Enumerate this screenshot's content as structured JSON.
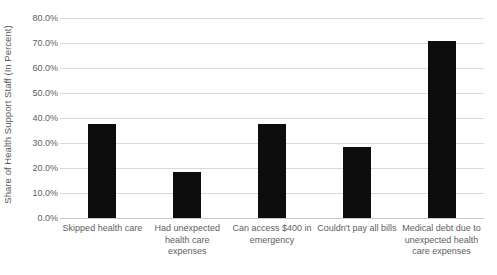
{
  "chart_data": {
    "type": "bar",
    "title": "",
    "subtitle": "",
    "xlabel": "",
    "ylabel": "Share of Health Support Staff (In Percent)",
    "categories": [
      "Skipped health care",
      "Had unexpected health care expenses",
      "Can access $400 in emergency",
      "Couldn't pay all bills",
      "Medical debt due to unexpected health care expenses"
    ],
    "values": [
      37.5,
      18.5,
      37.5,
      28.5,
      70.8
    ],
    "ylim": [
      0,
      80
    ],
    "ytick_step": 10,
    "ytick_labels": [
      "0.0%",
      "10.0%",
      "20.0%",
      "30.0%",
      "40.0%",
      "50.0%",
      "60.0%",
      "70.0%",
      "80.0%"
    ],
    "ytick_values": [
      0,
      10,
      20,
      30,
      40,
      50,
      60,
      70,
      80
    ],
    "grid": true,
    "grid_axis": "y",
    "legend": false,
    "legend_position": "none",
    "bar_color": "#0d0d0d",
    "gridline_color": "#d9d9d9",
    "text_color": "#5e5e5e",
    "background_color": "#ffffff"
  }
}
